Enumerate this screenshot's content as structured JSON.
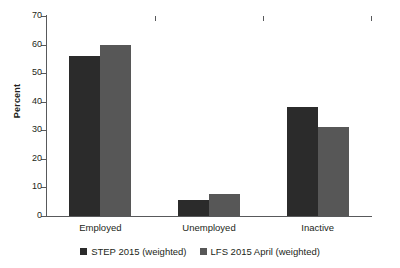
{
  "chart_data": {
    "type": "bar",
    "title": "",
    "subtitle": "",
    "xlabel": "",
    "ylabel": "Percent",
    "categories": [
      "Employed",
      "Unemployed",
      "Inactive"
    ],
    "series": [
      {
        "name": "STEP 2015 (weighted)",
        "color": "#2b2b2b",
        "values": [
          56,
          5.7,
          38
        ]
      },
      {
        "name": "LFS 2015 April (weighted)",
        "color": "#575757",
        "values": [
          60,
          7.8,
          31
        ]
      }
    ],
    "ylim": [
      0,
      70
    ],
    "ytick_values": [
      0,
      10,
      20,
      30,
      40,
      50,
      60,
      70
    ],
    "ytick_labels": [
      "0",
      "10",
      "20",
      "30",
      "40",
      "50",
      "60",
      "70"
    ],
    "grid": false,
    "legend_position": "bottom",
    "axis_color": "#58595b",
    "background": "#ffffff"
  }
}
